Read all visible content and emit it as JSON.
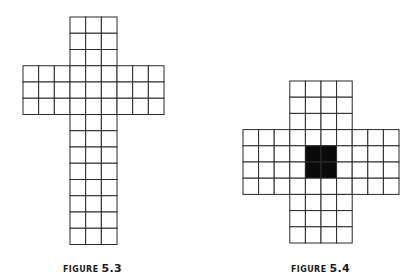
{
  "figures": [
    {
      "id": "fig-5-3",
      "caption_word": "FIGURE",
      "caption_number": "5.3",
      "shape": "cross",
      "origin": [
        23,
        17
      ],
      "cell_w": 15.67,
      "cell_h": 16.25,
      "blocks": [
        {
          "name": "top-arm",
          "col": 3,
          "row": 0,
          "cols": 3,
          "rows": 3
        },
        {
          "name": "cross-bar",
          "col": 0,
          "row": 3,
          "cols": 9,
          "rows": 3
        },
        {
          "name": "bottom-arm",
          "col": 3,
          "row": 6,
          "cols": 3,
          "rows": 8
        }
      ],
      "filled_cells": [],
      "caption_pos": [
        63,
        257
      ]
    },
    {
      "id": "fig-5-4",
      "caption_word": "FIGURE",
      "caption_number": "5.4",
      "shape": "plus",
      "origin": [
        243,
        81
      ],
      "cell_w": 15.6,
      "cell_h": 16.2,
      "blocks": [
        {
          "name": "top-arm",
          "col": 3,
          "row": 0,
          "cols": 4,
          "rows": 3
        },
        {
          "name": "middle-band",
          "col": 0,
          "row": 3,
          "cols": 10,
          "rows": 4
        },
        {
          "name": "bottom-arm",
          "col": 3,
          "row": 7,
          "cols": 4,
          "rows": 3
        }
      ],
      "filled_cells": [
        [
          4,
          4
        ],
        [
          5,
          4
        ],
        [
          4,
          5
        ],
        [
          5,
          5
        ]
      ],
      "filled_color": "#0a0a0a",
      "caption_pos": [
        291,
        257
      ]
    }
  ],
  "colors": {
    "grid_line": "#2a2a2a",
    "background": "#ffffff",
    "fill": "#0a0a0a",
    "caption": "#1a1a1a"
  }
}
